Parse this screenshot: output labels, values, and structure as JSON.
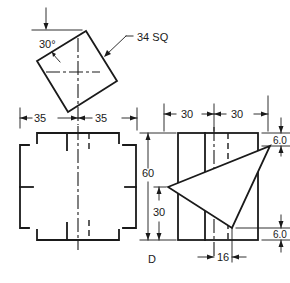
{
  "drawing": {
    "title": "Orthographic views of square prism with triangular cut",
    "top_view": {
      "angle_label": "30°",
      "size_label": "34 SQ"
    },
    "front_view": {
      "width_left_label": "35",
      "width_right_label": "35"
    },
    "side_view": {
      "width_left_label": "30",
      "width_right_label": "30",
      "height_label": "60",
      "vertex_height_label": "30",
      "top_offset_label": "6.0",
      "bottom_offset_label": "6.0",
      "bottom_width_label": "16",
      "view_label": "D"
    },
    "colors": {
      "line": "#1a1a1a",
      "background": "#ffffff"
    }
  }
}
